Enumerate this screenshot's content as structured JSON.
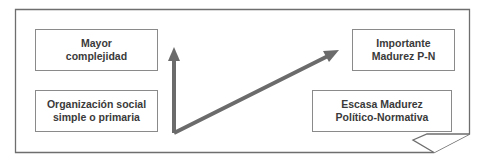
{
  "diagram": {
    "boxes": {
      "left_top": {
        "text": "Mayor\ncomplejidad"
      },
      "left_bottom": {
        "text": "Organización social\nsimple o primaria"
      },
      "right_top": {
        "text": "Importante\nMadurez P-N"
      },
      "right_bottom": {
        "text": "Escasa Madurez\nPolítico-Normativa"
      }
    },
    "arrows": [
      {
        "name": "vertical-arrow",
        "from": "origin",
        "to": "Mayor complejidad"
      },
      {
        "name": "diagonal-arrow",
        "from": "origin",
        "to": "Importante Madurez P-N"
      }
    ],
    "colors": {
      "frame": "#6e6e6e",
      "arrow": "#6b6b6b",
      "box_border": "#8a8a8a",
      "text": "#3a3a3a"
    }
  }
}
